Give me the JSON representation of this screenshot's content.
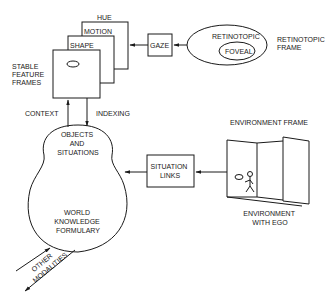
{
  "diagram": {
    "feature_frames": {
      "group_label": [
        "STABLE",
        "FEATURE",
        "FRAMES"
      ],
      "layers": [
        {
          "label": "HUE"
        },
        {
          "label": "MOTION"
        },
        {
          "label": "SHAPE"
        }
      ]
    },
    "gaze": {
      "label": "GAZE"
    },
    "retinotopic": {
      "outer_label": "RETINOTOPIC",
      "inner_label": "FOVEAL",
      "frame_label": [
        "RETINOTOPIC",
        "FRAME"
      ]
    },
    "arrows": {
      "context": "CONTEXT",
      "indexing": "INDEXING"
    },
    "knowledge_body": {
      "top_label": [
        "OBJECTS",
        "AND",
        "SITUATIONS"
      ],
      "bottom_label": [
        "WORLD",
        "KNOWLEDGE",
        "FORMULARY"
      ]
    },
    "situation_links": {
      "label": [
        "SITUATION",
        "LINKS"
      ]
    },
    "environment": {
      "frame_label": "ENVIRONMENT  FRAME",
      "caption": [
        "ENVIRONMENT",
        "WITH EGO"
      ]
    },
    "other_modalities": [
      "OTHER",
      "MODALITIES"
    ]
  }
}
